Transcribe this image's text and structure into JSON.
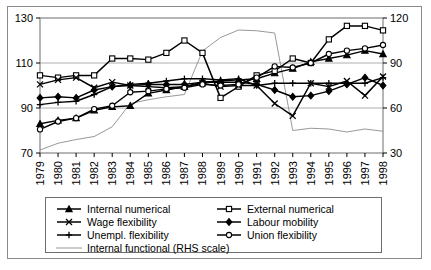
{
  "chart_data": {
    "type": "line",
    "title": "",
    "xlabel": "",
    "ylabel": "",
    "categories": [
      "1979",
      "1980",
      "1981",
      "1982",
      "1983",
      "1984",
      "1985",
      "1986",
      "1987",
      "1988",
      "1989",
      "1990",
      "1991",
      "1992",
      "1993",
      "1994",
      "1995",
      "1996",
      "1997",
      "1998"
    ],
    "ylim": [
      70,
      130
    ],
    "y_ticks": [
      70,
      90,
      110,
      130
    ],
    "y2lim": [
      30,
      120
    ],
    "y2_ticks": [
      30,
      60,
      90,
      120
    ],
    "y2_label": "RHS scale",
    "grid": true,
    "legend_position": "bottom",
    "series": [
      {
        "name": "Internal numerical",
        "axis": "left",
        "marker": "triangle",
        "values": [
          83.0,
          84.5,
          85.5,
          89.0,
          90.5,
          91.0,
          96.5,
          98.0,
          99.5,
          101.5,
          102.0,
          102.5,
          103.0,
          105.5,
          107.5,
          110.5,
          112.0,
          113.5,
          115.5,
          114.0
        ]
      },
      {
        "name": "External numerical",
        "axis": "left",
        "marker": "square",
        "values": [
          104.5,
          103.5,
          104.5,
          104.5,
          112.0,
          112.0,
          111.5,
          114.5,
          120.0,
          114.5,
          94.5,
          99.5,
          104.5,
          106.5,
          112.0,
          110.0,
          120.5,
          126.5,
          126.5,
          124.5
        ]
      },
      {
        "name": "Wage flexibility",
        "axis": "left",
        "marker": "cross",
        "values": [
          100.5,
          102.5,
          103.5,
          99.0,
          101.5,
          100.0,
          99.5,
          99.0,
          99.5,
          101.0,
          99.5,
          100.0,
          100.0,
          92.0,
          86.5,
          101.0,
          99.5,
          102.0,
          95.5,
          104.0
        ]
      },
      {
        "name": "Labour mobility",
        "axis": "left",
        "marker": "diamond",
        "values": [
          94.5,
          95.0,
          94.5,
          98.0,
          99.5,
          100.0,
          100.5,
          100.5,
          100.5,
          101.5,
          101.5,
          101.5,
          100.5,
          98.0,
          95.0,
          95.5,
          97.5,
          100.5,
          103.5,
          100.0
        ]
      },
      {
        "name": "Unempl. flexibility",
        "axis": "left",
        "marker": "plus",
        "values": [
          91.5,
          92.5,
          93.0,
          96.0,
          99.5,
          100.5,
          101.0,
          102.0,
          103.0,
          103.0,
          102.5,
          103.0,
          100.0,
          101.0,
          101.0,
          101.0,
          101.0,
          101.0,
          101.0,
          103.5
        ]
      },
      {
        "name": "Union flexibility",
        "axis": "left",
        "marker": "circle",
        "values": [
          80.5,
          84.0,
          85.5,
          89.5,
          91.0,
          97.0,
          97.5,
          98.5,
          99.0,
          100.5,
          100.0,
          100.5,
          103.5,
          108.5,
          108.0,
          110.0,
          114.0,
          115.5,
          116.5,
          118.0
        ]
      },
      {
        "name": "Internal functional (RHS scale)",
        "axis": "right",
        "marker": "none",
        "thin": true,
        "values": [
          32.0,
          36.5,
          39.0,
          41.0,
          47.5,
          63.0,
          65.5,
          67.5,
          69.0,
          98.0,
          107.0,
          112.0,
          111.5,
          110.0,
          45.0,
          46.5,
          46.0,
          44.0,
          46.0,
          44.5
        ]
      }
    ]
  },
  "axes": {
    "left_ticks": [
      "130",
      "110",
      "90",
      "70"
    ],
    "right_ticks": [
      "120",
      "90",
      "60",
      "30"
    ],
    "x_labels": [
      "1979",
      "1980",
      "1981",
      "1982",
      "1983",
      "1984",
      "1985",
      "1986",
      "1987",
      "1988",
      "1989",
      "1990",
      "1991",
      "1992",
      "1993",
      "1994",
      "1995",
      "1996",
      "1997",
      "1998"
    ]
  },
  "legend": {
    "items": [
      {
        "label": "Internal numerical",
        "marker": "triangle",
        "col": 0,
        "row": 0
      },
      {
        "label": "External numerical",
        "marker": "square",
        "col": 1,
        "row": 0
      },
      {
        "label": "Wage flexibility",
        "marker": "cross",
        "col": 0,
        "row": 1
      },
      {
        "label": "Labour mobility",
        "marker": "diamond",
        "col": 1,
        "row": 1
      },
      {
        "label": "Unempl. flexibility",
        "marker": "plus",
        "col": 0,
        "row": 2
      },
      {
        "label": "Union flexibility",
        "marker": "circle",
        "col": 1,
        "row": 2
      },
      {
        "label": "Internal functional (RHS scale)",
        "marker": "none",
        "col": 0,
        "row": 3
      }
    ]
  },
  "colors": {
    "line": "#000000",
    "thin_line": "#8c8c8c",
    "grid": "#9a9a9a",
    "frame": "#6d6d6d",
    "outer_frame": "#8a8a8a",
    "background": "#ffffff"
  }
}
